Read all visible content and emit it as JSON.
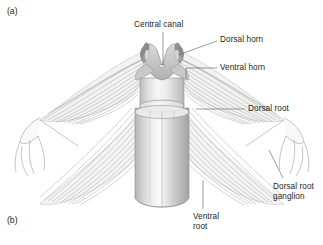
{
  "figure": {
    "kind": "anatomical-line-diagram",
    "background_color": "#ffffff",
    "line_color": "#6e6e6e",
    "text_color": "#231f20",
    "gray_matter_color": "#8d8d8d",
    "cord_color": "#cfcfcf"
  },
  "panels": [
    {
      "id": "a",
      "tag": "(a)",
      "x": 7,
      "y": 6
    },
    {
      "id": "b",
      "tag": "(b)",
      "x": 7,
      "y": 215
    }
  ],
  "labels": [
    {
      "id": "central-canal",
      "text": "Central canal",
      "x": 134,
      "y": 20,
      "align": "left",
      "leader": "vertical line from 163,32 down to 163,66"
    },
    {
      "id": "dorsal-horn",
      "text": "Dorsal horn",
      "x": 220,
      "y": 35,
      "align": "left",
      "leader": "diagonal line from 217,41 to 178,56"
    },
    {
      "id": "ventral-horn",
      "text": "Ventral horn",
      "x": 220,
      "y": 63,
      "align": "left",
      "leader": "horizontal 217,68 to 184,68 then down to 184,78"
    },
    {
      "id": "dorsal-root",
      "text": "Dorsal root",
      "x": 248,
      "y": 104,
      "align": "left",
      "leader": "horizontal line from 245,109 to 196,109"
    },
    {
      "id": "dorsal-root-ganglion",
      "text": "Dorsal root\nganglion",
      "x": 273,
      "y": 182,
      "align": "left",
      "leader": "diagonal line from 282,178 up to 268,150"
    },
    {
      "id": "ventral-root",
      "text": "Ventral\nroot",
      "x": 193,
      "y": 212,
      "align": "left",
      "leader": "vertical line from 203,208 up to 203,180"
    }
  ],
  "anatomy": {
    "structures": [
      "spinal cord cylinder",
      "gray matter butterfly",
      "left dorsal horn",
      "right dorsal horn",
      "central canal",
      "dorsal root fiber fan (upper left)",
      "dorsal root fiber fan (upper right)",
      "ventral root fiber fan (lower left)",
      "ventral root fiber fan (lower right)",
      "left dorsal root ganglion with branching nerve",
      "right dorsal root ganglion with branching nerve"
    ]
  }
}
